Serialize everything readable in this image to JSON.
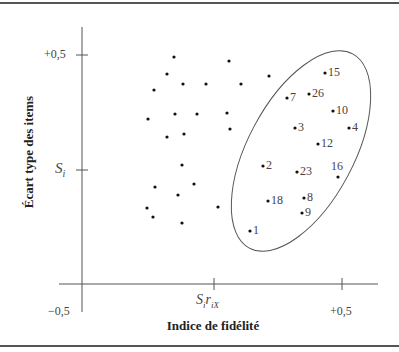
{
  "chart_data": {
    "type": "scatter",
    "title": "",
    "xlabel": "Indice de fidélité",
    "ylabel": "Écart type des items",
    "x_ticks": [
      {
        "label": "−0,5",
        "value": -0.5
      },
      {
        "label": "SiriX",
        "value": 0.0,
        "display": {
          "base": "S",
          "sub1": "i",
          "mid": "r",
          "sub2": "iX"
        }
      },
      {
        "label": "+0,5",
        "value": 0.5
      }
    ],
    "y_ticks": [
      {
        "label": "+0,5",
        "value": 0.5
      },
      {
        "label": "Si",
        "value": 0.25,
        "display": {
          "base": "S",
          "sub": "i"
        }
      }
    ],
    "xlim": [
      -0.5,
      0.6
    ],
    "ylim": [
      -0.25,
      0.6
    ],
    "grid": false,
    "legend": null,
    "annotation": "Ellipse encloses selected (labeled) items with high fidelity index and high item standard deviation",
    "labeled_points": [
      {
        "label": "15",
        "x": 0.435,
        "y": 0.461
      },
      {
        "label": "7",
        "x": 0.288,
        "y": 0.407
      },
      {
        "label": "26",
        "x": 0.373,
        "y": 0.415
      },
      {
        "label": "10",
        "x": 0.465,
        "y": 0.378
      },
      {
        "label": "3",
        "x": 0.319,
        "y": 0.341
      },
      {
        "label": "4",
        "x": 0.527,
        "y": 0.341
      },
      {
        "label": "12",
        "x": 0.408,
        "y": 0.307
      },
      {
        "label": "2",
        "x": 0.196,
        "y": 0.259
      },
      {
        "label": "23",
        "x": 0.327,
        "y": 0.246
      },
      {
        "label": "16",
        "x": 0.485,
        "y": 0.235
      },
      {
        "label": "18",
        "x": 0.215,
        "y": 0.183
      },
      {
        "label": "8",
        "x": 0.354,
        "y": 0.189
      },
      {
        "label": "9",
        "x": 0.346,
        "y": 0.157
      },
      {
        "label": "1",
        "x": 0.146,
        "y": 0.118
      }
    ],
    "unlabeled_points": [
      {
        "x": -0.146,
        "y": 0.474
      },
      {
        "x": 0.065,
        "y": 0.465
      },
      {
        "x": -0.173,
        "y": 0.437
      },
      {
        "x": -0.112,
        "y": 0.415
      },
      {
        "x": -0.023,
        "y": 0.415
      },
      {
        "x": 0.112,
        "y": 0.415
      },
      {
        "x": 0.219,
        "y": 0.431
      },
      {
        "x": -0.223,
        "y": 0.402
      },
      {
        "x": -0.246,
        "y": 0.339
      },
      {
        "x": -0.142,
        "y": 0.35
      },
      {
        "x": -0.058,
        "y": 0.35
      },
      {
        "x": 0.058,
        "y": 0.352
      },
      {
        "x": 0.069,
        "y": 0.317
      },
      {
        "x": -0.173,
        "y": 0.3
      },
      {
        "x": -0.108,
        "y": 0.307
      },
      {
        "x": -0.115,
        "y": 0.239
      },
      {
        "x": -0.219,
        "y": 0.191
      },
      {
        "x": -0.069,
        "y": 0.198
      },
      {
        "x": -0.131,
        "y": 0.174
      },
      {
        "x": -0.25,
        "y": 0.146
      },
      {
        "x": -0.227,
        "y": 0.126
      },
      {
        "x": -0.115,
        "y": 0.113
      },
      {
        "x": 0.023,
        "y": 0.15
      }
    ]
  },
  "render": {
    "labeled": [
      {
        "label": "15",
        "px": 325,
        "py": 73
      },
      {
        "label": "7",
        "px": 287,
        "py": 98
      },
      {
        "label": "26",
        "px": 309,
        "py": 94
      },
      {
        "label": "10",
        "px": 333,
        "py": 111
      },
      {
        "label": "3",
        "px": 295,
        "py": 128
      },
      {
        "label": "4",
        "px": 349,
        "py": 128
      },
      {
        "label": "12",
        "px": 318,
        "py": 144
      },
      {
        "label": "2",
        "px": 263,
        "py": 166
      },
      {
        "label": "23",
        "px": 297,
        "py": 172
      },
      {
        "label": "16",
        "px": 338,
        "py": 177,
        "above": true
      },
      {
        "label": "18",
        "px": 268,
        "py": 201
      },
      {
        "label": "8",
        "px": 304,
        "py": 198
      },
      {
        "label": "9",
        "px": 302,
        "py": 213
      },
      {
        "label": "1",
        "px": 250,
        "py": 231
      }
    ],
    "unlabeled": [
      [
        174,
        57
      ],
      [
        229,
        61
      ],
      [
        167,
        74
      ],
      [
        183,
        84
      ],
      [
        206,
        84
      ],
      [
        241,
        84
      ],
      [
        269,
        76
      ],
      [
        154,
        90
      ],
      [
        148,
        119
      ],
      [
        175,
        114
      ],
      [
        197,
        114
      ],
      [
        227,
        113
      ],
      [
        230,
        129
      ],
      [
        167,
        137
      ],
      [
        184,
        134
      ],
      [
        182,
        165
      ],
      [
        155,
        187
      ],
      [
        194,
        184
      ],
      [
        178,
        195
      ],
      [
        147,
        208
      ],
      [
        153,
        217
      ],
      [
        182,
        223
      ],
      [
        218,
        207
      ]
    ]
  },
  "labels": {
    "y_title": "Écart type des items",
    "x_title": "Indice de fidélité",
    "y_tick_top": "+0,5",
    "y_tick_si_base": "S",
    "y_tick_si_sub": "i",
    "x_tick_left": "−0,5",
    "x_tick_mid_base": "S",
    "x_tick_mid_sub1": "i",
    "x_tick_mid_r": "r",
    "x_tick_mid_sub2": "iX",
    "x_tick_right": "+0,5"
  }
}
